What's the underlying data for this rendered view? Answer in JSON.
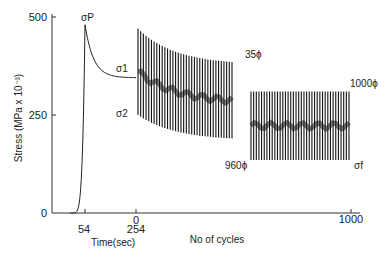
{
  "chart_data": {
    "type": "line",
    "title": "",
    "ylabel": "Stress (MPa x 10⁻³)",
    "xlabels": [
      "Time(sec)",
      "No of cycles"
    ],
    "ylim": [
      0,
      500
    ],
    "y_ticks": [
      {
        "value": 0,
        "label": "0"
      },
      {
        "value": 250,
        "label": "250"
      },
      {
        "value": 500,
        "label": "500"
      }
    ],
    "x_ticks": [
      {
        "label": "54"
      },
      {
        "label": "254",
        "sublabel": "0"
      },
      {
        "label": "1000"
      }
    ],
    "segments": {
      "creep": {
        "name": "loading and relaxation (time)",
        "time_sec": [
          0,
          54,
          254
        ],
        "stress": [
          0,
          480,
          345
        ]
      },
      "fatigue_early": {
        "name": "cycles 0-35",
        "cycles": [
          0,
          35
        ],
        "max_stress": [
          470,
          385
        ],
        "min_stress": [
          250,
          190
        ]
      },
      "fatigue_late": {
        "name": "cycles 960-1000",
        "cycles": [
          960,
          1000
        ],
        "max_stress": [
          310,
          310
        ],
        "min_stress": [
          135,
          135
        ]
      }
    },
    "annotations": [
      {
        "text": "σP",
        "meaning": "peak stress"
      },
      {
        "text": "σ1"
      },
      {
        "text": "σ2"
      },
      {
        "text": "35ϕ"
      },
      {
        "text": "1000ϕ"
      },
      {
        "text": "960ϕ"
      },
      {
        "text": "σf"
      }
    ],
    "grid": false,
    "legend": "none"
  }
}
